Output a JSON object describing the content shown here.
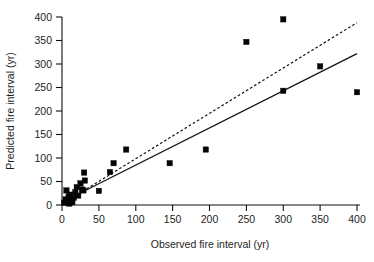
{
  "chart_data": {
    "type": "scatter",
    "title": "",
    "xlabel": "Observed fire interval (yr)",
    "ylabel": "Predicted fire interval (yr)",
    "xlim": [
      0,
      400
    ],
    "ylim": [
      0,
      400
    ],
    "xticks": [
      0,
      50,
      100,
      150,
      200,
      250,
      300,
      350,
      400
    ],
    "yticks": [
      0,
      50,
      100,
      150,
      200,
      250,
      300,
      350,
      400
    ],
    "xtick_labels": [
      "0",
      "50",
      "100",
      "150",
      "200",
      "250",
      "300",
      "350",
      "400"
    ],
    "ytick_labels": [
      "0",
      "50",
      "100",
      "150",
      "200",
      "250",
      "300",
      "350",
      "400"
    ],
    "grid": false,
    "legend": "none",
    "marker_style": "filled-square",
    "points": [
      {
        "x": 3,
        "y": 5
      },
      {
        "x": 5,
        "y": 12
      },
      {
        "x": 6,
        "y": 31
      },
      {
        "x": 8,
        "y": 8
      },
      {
        "x": 9,
        "y": 18
      },
      {
        "x": 10,
        "y": 3
      },
      {
        "x": 11,
        "y": 22
      },
      {
        "x": 12,
        "y": 10
      },
      {
        "x": 14,
        "y": 6
      },
      {
        "x": 16,
        "y": 15
      },
      {
        "x": 18,
        "y": 27
      },
      {
        "x": 20,
        "y": 38
      },
      {
        "x": 22,
        "y": 20
      },
      {
        "x": 25,
        "y": 46
      },
      {
        "x": 27,
        "y": 33
      },
      {
        "x": 29,
        "y": 31
      },
      {
        "x": 30,
        "y": 69
      },
      {
        "x": 31,
        "y": 52
      },
      {
        "x": 50,
        "y": 30
      },
      {
        "x": 65,
        "y": 70
      },
      {
        "x": 87,
        "y": 118
      },
      {
        "x": 70,
        "y": 89
      },
      {
        "x": 146,
        "y": 89
      },
      {
        "x": 195,
        "y": 118
      },
      {
        "x": 250,
        "y": 347
      },
      {
        "x": 300,
        "y": 395
      },
      {
        "x": 300,
        "y": 243
      },
      {
        "x": 350,
        "y": 295
      },
      {
        "x": 400,
        "y": 240
      }
    ],
    "lines": [
      {
        "name": "regression-line",
        "style": "solid",
        "x": [
          0,
          400
        ],
        "y": [
          6,
          322
        ]
      },
      {
        "name": "one-to-one-reference-line",
        "style": "dashed",
        "x": [
          0,
          400
        ],
        "y": [
          2,
          388
        ]
      }
    ]
  },
  "colors": {
    "marker": "#050505",
    "axis": "#111111",
    "text": "#1d1d1d",
    "background": "#ffffff"
  }
}
